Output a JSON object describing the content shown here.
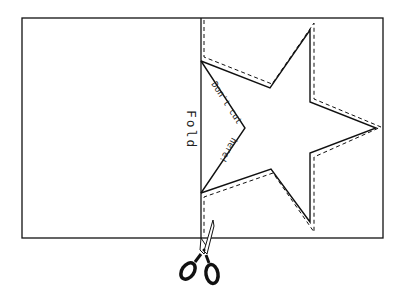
{
  "diagram": {
    "type": "paper-cutting-instruction",
    "labels": {
      "fold": "Fold",
      "dont_cut": "Don't cut here!"
    },
    "elements": {
      "paper": "rectangular sheet folded in half",
      "fold_line": "vertical center line",
      "star_outline": "half of a five-pointed star drawn against the fold",
      "cut_line": "dashed line following star outline",
      "scissors": "scissors-icon at bottom of fold"
    },
    "colors": {
      "line": "#111111",
      "background": "#ffffff"
    }
  }
}
